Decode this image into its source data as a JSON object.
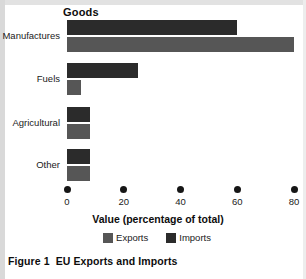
{
  "chart_data": {
    "type": "bar",
    "orientation": "horizontal",
    "title": "Goods",
    "xlabel": "Value (percentage of total)",
    "ylabel": "",
    "categories": [
      "Manufactures",
      "Fuels",
      "Agricultural",
      "Other"
    ],
    "series": [
      {
        "name": "Imports",
        "color": "#2b2b2b",
        "values": [
          60,
          25,
          8,
          8
        ]
      },
      {
        "name": "Exports",
        "color": "#565656",
        "values": [
          80,
          5,
          8,
          8
        ]
      }
    ],
    "xlim": [
      0,
      80
    ],
    "xticks": [
      0,
      20,
      40,
      60,
      80
    ],
    "xtick_labels": [
      "0",
      "20",
      "40",
      "60",
      "80"
    ],
    "grid": false,
    "legend_position": "bottom-center",
    "legend_entries": [
      "Exports",
      "Imports"
    ]
  },
  "caption": {
    "figure_number": "Figure 1",
    "figure_title": "EU Exports and Imports"
  }
}
